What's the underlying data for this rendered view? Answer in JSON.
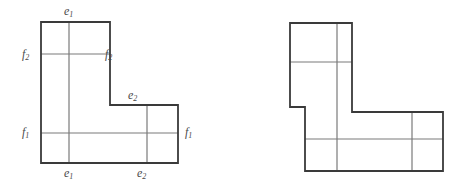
{
  "figure": {
    "stroke_color": "#3a3a3a",
    "grid_color": "#7a7a7a",
    "background_color": "#ffffff",
    "outline_width": 1.8,
    "grid_width": 1.2
  },
  "left_figure": {
    "name": "left-polyomino",
    "outline_points": "41,22 110,22 110,105 178,105 178,163 41,163",
    "grid_lines": [
      {
        "name": "vertical-grid-1",
        "x1": 69,
        "y1": 22,
        "x2": 69,
        "y2": 163
      },
      {
        "name": "horizontal-grid-top",
        "x1": 41,
        "y1": 54,
        "x2": 110,
        "y2": 54
      },
      {
        "name": "horizontal-grid-bottom",
        "x1": 41,
        "y1": 133,
        "x2": 178,
        "y2": 133
      },
      {
        "name": "vertical-grid-2",
        "x1": 147,
        "y1": 105,
        "x2": 147,
        "y2": 163
      }
    ],
    "labels": [
      {
        "name": "label-top-e1",
        "text": "e",
        "sub": "1",
        "x": 64,
        "y": 5
      },
      {
        "name": "label-left-f2",
        "text": "f",
        "sub": "2",
        "x": 22,
        "y": 48
      },
      {
        "name": "label-right-f2",
        "text": "f",
        "sub": "2",
        "x": 105,
        "y": 48
      },
      {
        "name": "label-mid-e2",
        "text": "e",
        "sub": "2",
        "x": 128,
        "y": 89
      },
      {
        "name": "label-left-f1",
        "text": "f",
        "sub": "1",
        "x": 22,
        "y": 126
      },
      {
        "name": "label-right-f1",
        "text": "f",
        "sub": "1",
        "x": 185,
        "y": 126
      },
      {
        "name": "label-bottom-e1",
        "text": "e",
        "sub": "1",
        "x": 64,
        "y": 167
      },
      {
        "name": "label-bottom-e2",
        "text": "e",
        "sub": "2",
        "x": 137,
        "y": 167
      }
    ]
  },
  "right_figure": {
    "name": "right-polyomino",
    "outline_points": "290,23 352,23 352,112 443,112 443,171 305,171 305,107 290,107",
    "grid_lines": [
      {
        "name": "vertical-grid-1",
        "x1": 337,
        "y1": 23,
        "x2": 337,
        "y2": 171
      },
      {
        "name": "horizontal-grid-top",
        "x1": 290,
        "y1": 62,
        "x2": 352,
        "y2": 62
      },
      {
        "name": "horizontal-grid-bottom",
        "x1": 305,
        "y1": 139,
        "x2": 443,
        "y2": 139
      },
      {
        "name": "vertical-grid-2",
        "x1": 412,
        "y1": 112,
        "x2": 412,
        "y2": 171
      }
    ]
  }
}
